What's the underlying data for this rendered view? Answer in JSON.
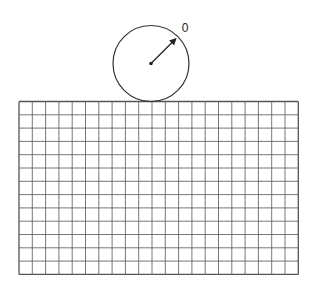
{
  "diagram": {
    "wheel": {
      "center": [
        151,
        63.5
      ],
      "radius": 38,
      "pointer_label": "0",
      "pointer_angle_deg": -45
    },
    "grid": {
      "x": 19,
      "y": 101.5,
      "columns": 21,
      "rows": 13,
      "cell_size": 13.3
    },
    "colors": {
      "stroke": "#333333",
      "grid_line": "#555555",
      "background": "#ffffff"
    }
  }
}
